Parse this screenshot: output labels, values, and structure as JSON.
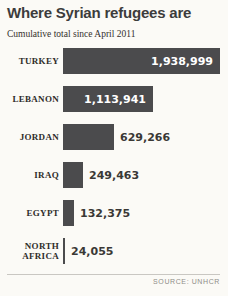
{
  "chart_data": {
    "type": "bar",
    "orientation": "horizontal",
    "title": "Where Syrian refugees are",
    "subtitle": "Cumulative total since April 2011",
    "categories": [
      "TURKEY",
      "LEBANON",
      "JORDAN",
      "IRAQ",
      "EGYPT",
      "NORTH AFRICA"
    ],
    "values": [
      1938999,
      1113941,
      629266,
      249463,
      132375,
      24055
    ],
    "value_labels": [
      "1,938,999",
      "1,113,941",
      "629,266",
      "249,463",
      "132,375",
      "24,055"
    ],
    "xlim": [
      0,
      1938999
    ],
    "grid": false,
    "legend": "none",
    "source": "SOURCE: UNHCR",
    "colors": {
      "bar": "#4b4b4d",
      "value_inside": "#ffffff",
      "value_outside": "#3a3835",
      "background": "#fbfaf6"
    }
  }
}
